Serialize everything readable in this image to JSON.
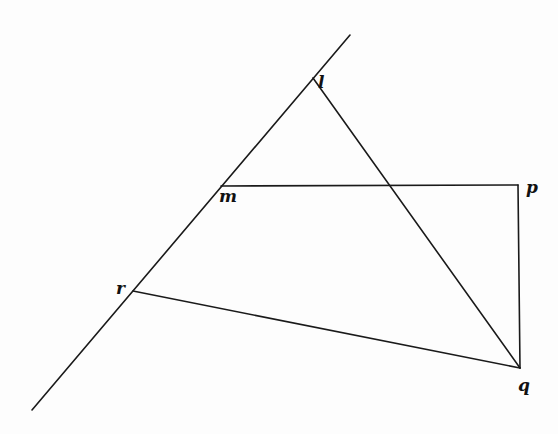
{
  "diagram": {
    "background": "#fdfdfd",
    "stroke_color": "#1a1a1a",
    "points": {
      "l": {
        "x": 313,
        "y": 78
      },
      "m": {
        "x": 221,
        "y": 186
      },
      "r": {
        "x": 133,
        "y": 291
      },
      "p": {
        "x": 518,
        "y": 185
      },
      "q": {
        "x": 520,
        "y": 368
      }
    },
    "labels": {
      "l": "l",
      "m": "m",
      "p": "p",
      "r": "r",
      "q": "q"
    },
    "segments": [
      {
        "name": "transversal-line",
        "from": [
          32,
          410
        ],
        "to": [
          350,
          35
        ]
      },
      {
        "name": "segment-lq",
        "from": "l",
        "to": "q"
      },
      {
        "name": "segment-mp",
        "from": "m",
        "to": "p"
      },
      {
        "name": "segment-pq",
        "from": "p",
        "to": "q"
      },
      {
        "name": "segment-rq",
        "from": "r",
        "to": "q"
      }
    ]
  }
}
